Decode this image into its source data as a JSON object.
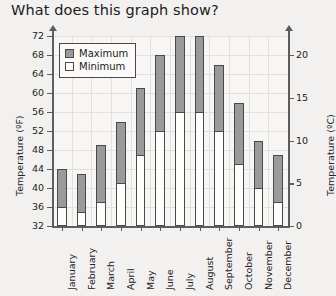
{
  "title": "What does this graph show?",
  "legend": {
    "items": [
      {
        "label": "Maximum",
        "swatch": "#9a9a9a"
      },
      {
        "label": "Minimum",
        "swatch": "#fdfdfc"
      }
    ]
  },
  "axes": {
    "left_title": "Temperature (ºF)",
    "right_title": "Temperature (ºC)",
    "left_ticks": [
      "32",
      "36",
      "40",
      "44",
      "48",
      "52",
      "56",
      "60",
      "64",
      "68",
      "72"
    ],
    "right_ticks": [
      "0",
      "5",
      "10",
      "15",
      "20"
    ]
  },
  "chart_data": {
    "type": "bar",
    "title": "What does this graph show?",
    "xlabel": "",
    "ylabel": "Temperature (ºF)",
    "y2label": "Temperature (ºC)",
    "ylim": [
      32,
      72
    ],
    "ytick_step": 4,
    "y2lim": [
      0,
      22.2
    ],
    "y2ticks": [
      0,
      5,
      10,
      15,
      20
    ],
    "grid": true,
    "legend_position": "upper-left",
    "bar_style": "overlaid-range",
    "categories": [
      "January",
      "February",
      "March",
      "April",
      "May",
      "June",
      "July",
      "August",
      "September",
      "October",
      "November",
      "December"
    ],
    "series": [
      {
        "name": "Maximum",
        "values": [
          44,
          43,
          49,
          54,
          61,
          68,
          72,
          72,
          66,
          58,
          50,
          47
        ]
      },
      {
        "name": "Minimum",
        "values": [
          36,
          35,
          37,
          41,
          47,
          52,
          56,
          56,
          52,
          45,
          40,
          37
        ]
      }
    ]
  }
}
